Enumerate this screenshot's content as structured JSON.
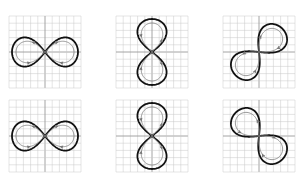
{
  "figure": {
    "grid": {
      "cells": 10,
      "minor_color": "#c8c8c8",
      "axis_color": "#9a9a9a",
      "border_color": "#bdbdbd"
    },
    "colors": {
      "outer_curve": "#111111",
      "inner_curve": "#8a8a8a",
      "arrow": "#7a7a7a"
    },
    "panels": [
      {
        "id": "p1",
        "row": 0,
        "col": 0,
        "x": 9,
        "y": 16,
        "orientation": "horizontal",
        "rotation": 0
      },
      {
        "id": "p2",
        "row": 0,
        "col": 1,
        "x": 116,
        "y": 16,
        "orientation": "vertical",
        "rotation": 90
      },
      {
        "id": "p3",
        "row": 0,
        "col": 2,
        "x": 223,
        "y": 16,
        "orientation": "diagonal",
        "rotation": -45
      },
      {
        "id": "p4",
        "row": 1,
        "col": 0,
        "x": 9,
        "y": 100,
        "orientation": "horizontal",
        "rotation": 0
      },
      {
        "id": "p5",
        "row": 1,
        "col": 1,
        "x": 116,
        "y": 100,
        "orientation": "vertical",
        "rotation": 90
      },
      {
        "id": "p6",
        "row": 1,
        "col": 2,
        "x": 223,
        "y": 100,
        "orientation": "diagonal",
        "rotation": 45
      }
    ]
  }
}
